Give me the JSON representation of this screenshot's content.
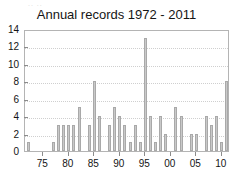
{
  "figure": {
    "top_artifact_text": "..  ..",
    "bar_color": "#c9c9c9",
    "bar_edge_color": "#a9a9a9",
    "frame_color": "#b4b4b4",
    "grid_color": "#cfcfcf",
    "background": "#ffffff"
  },
  "chart_data": {
    "type": "bar",
    "title": "Annual records 1972 - 2011",
    "xlabel": "",
    "ylabel": "",
    "ylim": [
      0,
      14
    ],
    "xlim": [
      1971.4,
      2011.6
    ],
    "grid": true,
    "legend": null,
    "y_ticks": [
      0,
      2,
      4,
      6,
      8,
      10,
      12,
      14
    ],
    "y_tick_labels": [
      "0",
      "2",
      "4",
      "6",
      "8",
      "10",
      "12",
      "14"
    ],
    "x_ticks": [
      1975,
      1980,
      1985,
      1990,
      1995,
      2000,
      2005,
      2010
    ],
    "x_tick_labels": [
      "75",
      "80",
      "85",
      "90",
      "95",
      "00",
      "05",
      "10"
    ],
    "categories": [
      "1972",
      "1973",
      "1974",
      "1975",
      "1976",
      "1977",
      "1978",
      "1979",
      "1980",
      "1981",
      "1982",
      "1983",
      "1984",
      "1985",
      "1986",
      "1987",
      "1988",
      "1989",
      "1990",
      "1991",
      "1992",
      "1993",
      "1994",
      "1995",
      "1996",
      "1997",
      "1998",
      "1999",
      "2000",
      "2001",
      "2002",
      "2003",
      "2004",
      "2005",
      "2006",
      "2007",
      "2008",
      "2009",
      "2010",
      "2011"
    ],
    "values": [
      1,
      0,
      0,
      0,
      0,
      1,
      3,
      3,
      3,
      3,
      5,
      0,
      3,
      8,
      4,
      0,
      3,
      5,
      4,
      3,
      1,
      3,
      1,
      13,
      4,
      1,
      4,
      2,
      0,
      5,
      4,
      0,
      2,
      2,
      0,
      4,
      3,
      4,
      1,
      8
    ],
    "values_alt_note": "",
    "max_value": 13,
    "max_value_year": "1995"
  }
}
